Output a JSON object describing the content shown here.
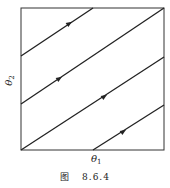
{
  "diagram": {
    "type": "phase-portrait-torus",
    "axes": {
      "x_label_base": "θ",
      "x_label_sub": "1",
      "y_label_base": "θ",
      "y_label_sub": "2"
    },
    "trajectories": [
      {
        "from": [
          21,
          56
        ],
        "to": [
          93,
          8
        ],
        "arrow_at": [
          69,
          24
        ]
      },
      {
        "from": [
          21,
          104
        ],
        "to": [
          164,
          8
        ],
        "arrow_at": [
          60,
          78
        ]
      },
      {
        "from": [
          21,
          150
        ],
        "to": [
          164,
          57
        ],
        "arrow_at": [
          105,
          96
        ]
      },
      {
        "from": [
          93,
          150
        ],
        "to": [
          164,
          105
        ],
        "arrow_at": [
          124,
          131
        ]
      }
    ],
    "frame": {
      "x": 21,
      "y": 8,
      "width": 143,
      "height": 142
    },
    "line_color": "#222222"
  },
  "caption": {
    "prefix": "图",
    "number": "8.6.4"
  }
}
